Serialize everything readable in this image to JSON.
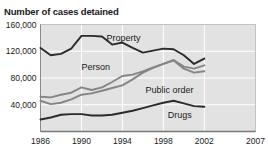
{
  "chart_data": {
    "type": "line",
    "title": "Number of cases detained",
    "xlabel": "",
    "ylabel": "",
    "xlim": [
      1986,
      2007
    ],
    "ylim": [
      0,
      160000
    ],
    "grid": true,
    "legend": "inline-labels",
    "x_ticks": [
      "1986",
      "1990",
      "1994",
      "1998",
      "2002",
      "2007"
    ],
    "x_tick_values": [
      1986,
      1990,
      1994,
      1998,
      2002,
      2007
    ],
    "y_ticks": [
      "40,000",
      "80,000",
      "120,000",
      "160,000"
    ],
    "y_tick_values": [
      40000,
      80000,
      120000,
      160000
    ],
    "x": [
      1986,
      1987,
      1988,
      1989,
      1990,
      1991,
      1992,
      1993,
      1994,
      1995,
      1996,
      1997,
      1998,
      1999,
      2000,
      2001,
      2002
    ],
    "series": [
      {
        "name": "Property",
        "color": "#2b2b2b",
        "label_x": 1994.1,
        "label_y": 140000,
        "values": [
          125000,
          114000,
          116000,
          124000,
          143000,
          143000,
          142000,
          130000,
          133000,
          125000,
          118000,
          121000,
          124000,
          123000,
          114000,
          101000,
          109000
        ]
      },
      {
        "name": "Person",
        "color": "#858585",
        "label_x": 1991.4,
        "label_y": 96000,
        "values": [
          52000,
          51000,
          55000,
          58000,
          66000,
          62000,
          66000,
          74000,
          83000,
          85000,
          90000,
          96000,
          101000,
          107000,
          97000,
          94000,
          99000
        ]
      },
      {
        "name": "Public order",
        "color": "#858585",
        "label_x": 1998.6,
        "label_y": 62000,
        "values": [
          46000,
          41000,
          43000,
          48000,
          55000,
          57000,
          61000,
          65000,
          69000,
          78000,
          88000,
          95000,
          101000,
          106000,
          94000,
          88000,
          90000
        ]
      },
      {
        "name": "Drugs",
        "color": "#2b2b2b",
        "label_x": 1999.6,
        "label_y": 25000,
        "values": [
          18000,
          21000,
          25000,
          26000,
          26000,
          24000,
          24000,
          25000,
          28000,
          31000,
          35000,
          39000,
          43000,
          46000,
          42000,
          38000,
          37000
        ]
      }
    ]
  }
}
